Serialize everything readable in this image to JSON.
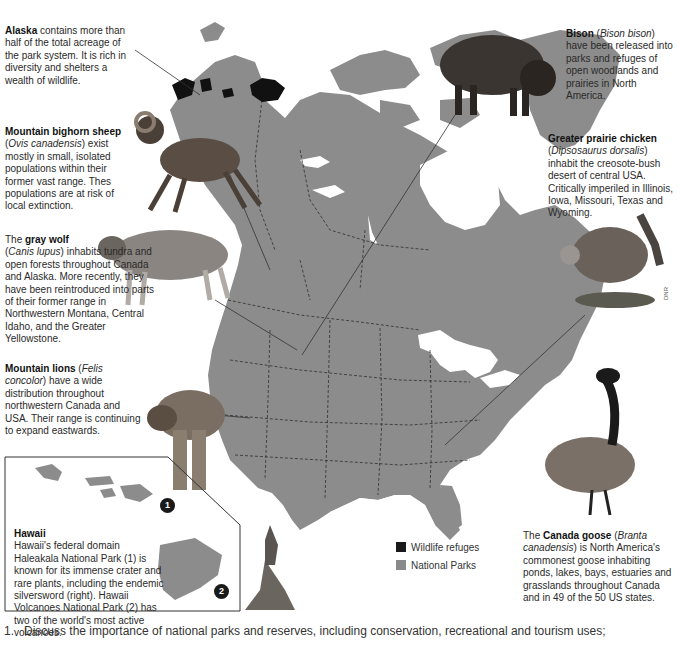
{
  "captions": {
    "alaska": {
      "title": "Alaska",
      "text": " contains more than half of the total acreage of the park system. It is rich in diversity and shelters a wealth of wildlife."
    },
    "sheep": {
      "title": "Mountain bighorn sheep",
      "latin": "Ovis canadensis",
      "text": ") exist mostly in small, isolated populations within their former vast range. Thes populations are at risk of local extinction."
    },
    "wolf": {
      "prefix": "The ",
      "title": "gray wolf",
      "latin": "Canis lupus",
      "text": ") inhabits tundra and open forests throughout Canada and Alaska. More recently, they have been reintroduced into parts of their former range in Northwestern Montana, Central Idaho, and the Greater Yellowstone."
    },
    "lion": {
      "title": "Mountain lions",
      "latin": "Felis concolor",
      "text": ") have a wide distribution throughout northwestern Canada and USA. Their range is continuing to expand eastwards."
    },
    "hawaii": {
      "title": "Hawaii",
      "text": "Hawaii's federal domain Haleakala National Park (1) is known for its immense crater and rare plants, including the endemic silversword (right). Hawaii Volcanoes National Park (2) has two of the world's most active volcanoes."
    },
    "bison": {
      "title": "Bison",
      "latin": "Bison bison",
      "text": ") have been released into parks and refuges of open woodlands and prairies in North America."
    },
    "chicken": {
      "title": "Greater prairie chicken",
      "latin": "Dipsosaurus dorsalis",
      "text": ") inhabit the creosote-bush desert of central USA. Critically imperiled in Illinois, Iowa, Missouri, Texas and Wyoming."
    },
    "goose": {
      "prefix": "The ",
      "title": "Canada goose",
      "latin": "Branta canadensis",
      "text": ") is North America's commonest goose inhabiting ponds, lakes, bays, estuaries and grasslands throughout Canada and in 49 of the 50 US states."
    }
  },
  "hawaii_markers": {
    "one": "1",
    "two": "2"
  },
  "legend": {
    "items": [
      {
        "label": "Wildlife refuges",
        "color": "#1a1a1a"
      },
      {
        "label": "National Parks",
        "color": "#8a8a8a"
      }
    ]
  },
  "credit": "DNR",
  "question": {
    "number": "1.",
    "text": "Discuss the importance of national parks and reserves, including conservation, recreational and tourism uses;"
  },
  "colors": {
    "land": "#8c8c8c",
    "water": "#ffffff",
    "refuge": "#111111"
  }
}
